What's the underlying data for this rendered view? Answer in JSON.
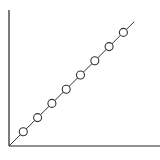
{
  "chart_data": {
    "type": "line",
    "title": "",
    "xlabel": "",
    "ylabel": "",
    "x": [
      1,
      2,
      3,
      4,
      5,
      6,
      7,
      8
    ],
    "series": [
      {
        "name": "series-1",
        "values": [
          1,
          2,
          3,
          4,
          5,
          6,
          7,
          8
        ],
        "marker": "open-circle",
        "line": "solid"
      }
    ],
    "trend_line": {
      "from": [
        0,
        0
      ],
      "to": [
        8.75,
        8.75
      ]
    },
    "xlim": [
      0,
      10.5
    ],
    "ylim": [
      0,
      9.5
    ],
    "grid": false,
    "legend": null,
    "ticks": false
  },
  "colors": {
    "axis": "#222222",
    "line": "#333333",
    "marker_stroke": "#333333",
    "marker_fill": "#ffffff",
    "background": "#ffffff"
  }
}
